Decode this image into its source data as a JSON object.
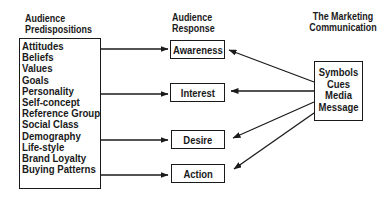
{
  "headers": {
    "predispositions": [
      "Audience",
      "Predispositions"
    ],
    "response": [
      "Audience",
      "Response"
    ],
    "communication": [
      "The Marketing",
      "Communication"
    ]
  },
  "predispositions": [
    "Attitudes",
    "Beliefs",
    "Values",
    "Goals",
    "Personality",
    "Self-concept",
    "Reference Group",
    "Social Class",
    "Demography",
    "Life-style",
    "Brand Loyalty",
    "Buying Patterns"
  ],
  "responses": [
    "Awareness",
    "Interest",
    "Desire",
    "Action"
  ],
  "communication_elements": [
    "Symbols",
    "Cues",
    "Media",
    "Message"
  ],
  "colors": {
    "line": "#1a1a1a",
    "background": "#ffffff"
  }
}
